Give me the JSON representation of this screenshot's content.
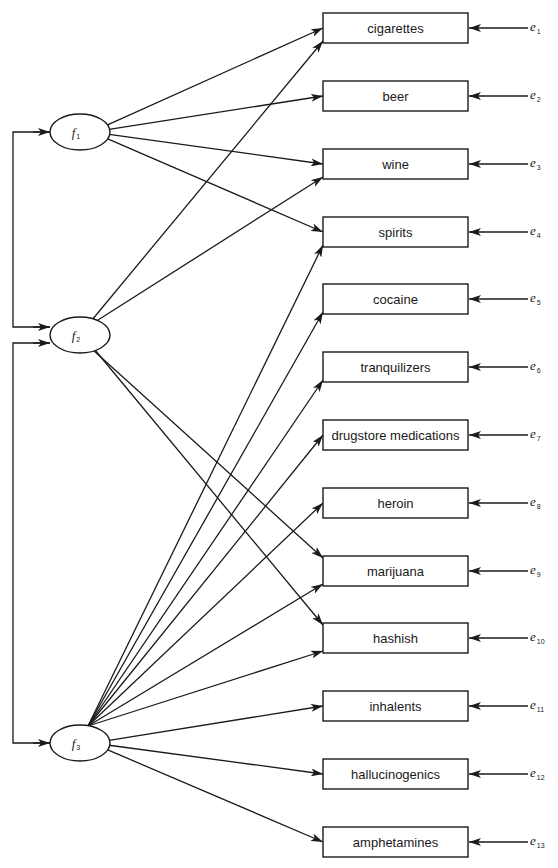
{
  "diagram": {
    "type": "confirmatory factor analysis path diagram",
    "factors": [
      {
        "id": "f1",
        "label": "f",
        "subscript": "1",
        "cx": 80,
        "cy": 132
      },
      {
        "id": "f2",
        "label": "f",
        "subscript": "2",
        "cx": 80,
        "cy": 335
      },
      {
        "id": "f3",
        "label": "f",
        "subscript": "3",
        "cx": 80,
        "cy": 743
      }
    ],
    "indicators": [
      {
        "id": "cigarettes",
        "label": "cigarettes",
        "y": 13,
        "error": "e",
        "error_sub": "1"
      },
      {
        "id": "beer",
        "label": "beer",
        "y": 81,
        "error": "e",
        "error_sub": "2"
      },
      {
        "id": "wine",
        "label": "wine",
        "y": 149,
        "error": "e",
        "error_sub": "3"
      },
      {
        "id": "spirits",
        "label": "spirits",
        "y": 217,
        "error": "e",
        "error_sub": "4"
      },
      {
        "id": "cocaine",
        "label": "cocaine",
        "y": 284,
        "error": "e",
        "error_sub": "5"
      },
      {
        "id": "tranquilizers",
        "label": "tranquilizers",
        "y": 352,
        "error": "e",
        "error_sub": "6"
      },
      {
        "id": "drugstore",
        "label": "drugstore medications",
        "y": 420,
        "error": "e",
        "error_sub": "7"
      },
      {
        "id": "heroin",
        "label": "heroin",
        "y": 488,
        "error": "e",
        "error_sub": "8"
      },
      {
        "id": "marijuana",
        "label": "marijuana",
        "y": 556,
        "error": "e",
        "error_sub": "9"
      },
      {
        "id": "hashish",
        "label": "hashish",
        "y": 623,
        "error": "e",
        "error_sub": "10"
      },
      {
        "id": "inhalents",
        "label": "inhalents",
        "y": 691,
        "error": "e",
        "error_sub": "11"
      },
      {
        "id": "hallucinogenics",
        "label": "hallucinogenics",
        "y": 759,
        "error": "e",
        "error_sub": "12"
      },
      {
        "id": "amphetamines",
        "label": "amphetamines",
        "y": 827,
        "error": "e",
        "error_sub": "13"
      }
    ],
    "loadings": {
      "f1": [
        "cigarettes",
        "beer",
        "wine",
        "spirits"
      ],
      "f2": [
        "cigarettes",
        "wine",
        "marijuana",
        "hashish"
      ],
      "f3": [
        "spirits",
        "cocaine",
        "tranquilizers",
        "drugstore",
        "heroin",
        "marijuana",
        "hashish",
        "inhalents",
        "hallucinogenics",
        "amphetamines"
      ]
    },
    "correlations": [
      [
        "f1",
        "f2"
      ],
      [
        "f2",
        "f3"
      ]
    ],
    "colors": {
      "stroke": "#1a1a1a",
      "background": "#ffffff"
    }
  }
}
